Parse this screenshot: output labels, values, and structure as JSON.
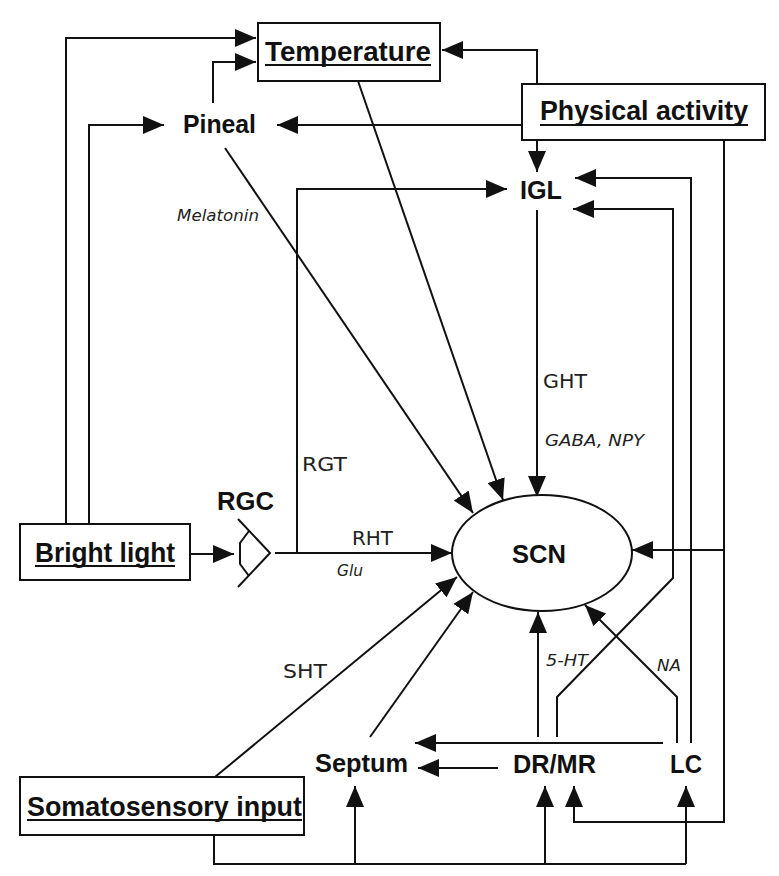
{
  "diagram": {
    "colors": {
      "stroke": "#111111",
      "background": "#ffffff"
    },
    "inputs": {
      "temperature": "Temperature",
      "physical_activity": "Physical activity",
      "bright_light": "Bright light",
      "somatosensory_input": "Somatosensory input"
    },
    "nodes": {
      "pineal": "Pineal",
      "igl": "IGL",
      "rgc": "RGC",
      "scn": "SCN",
      "septum": "Septum",
      "dr_mr": "DR/MR",
      "lc": "LC"
    },
    "pathways": {
      "rgt": "RGT",
      "rht": "RHT",
      "ght": "GHT",
      "sht": "SHT"
    },
    "transmitters": {
      "melatonin": "Melatonin",
      "glu": "Glu",
      "gaba_npy": "GABA, NPY",
      "serotonin": "5-HT",
      "noradrenaline": "NA"
    },
    "edges": [
      {
        "from": "Bright light",
        "to": "Temperature"
      },
      {
        "from": "Bright light",
        "to": "Pineal"
      },
      {
        "from": "Bright light",
        "to": "RGC"
      },
      {
        "from": "Pineal",
        "to": "Temperature"
      },
      {
        "from": "Pineal",
        "to": "SCN",
        "transmitter": "Melatonin"
      },
      {
        "from": "Physical activity",
        "to": "Temperature"
      },
      {
        "from": "Physical activity",
        "to": "Pineal"
      },
      {
        "from": "Physical activity",
        "to": "IGL"
      },
      {
        "from": "Physical activity",
        "to": "SCN"
      },
      {
        "from": "Physical activity",
        "to": "DR/MR"
      },
      {
        "from": "Temperature",
        "to": "SCN"
      },
      {
        "from": "RGC",
        "to": "IGL",
        "pathway": "RGT"
      },
      {
        "from": "RGC",
        "to": "SCN",
        "pathway": "RHT",
        "transmitter": "Glu"
      },
      {
        "from": "IGL",
        "to": "SCN",
        "pathway": "GHT",
        "transmitter": "GABA, NPY"
      },
      {
        "from": "DR/MR",
        "to": "SCN",
        "transmitter": "5-HT"
      },
      {
        "from": "DR/MR",
        "to": "IGL"
      },
      {
        "from": "DR/MR",
        "to": "Septum"
      },
      {
        "from": "LC",
        "to": "SCN",
        "transmitter": "NA"
      },
      {
        "from": "LC",
        "to": "IGL"
      },
      {
        "from": "LC",
        "to": "Septum"
      },
      {
        "from": "Septum",
        "to": "SCN"
      },
      {
        "from": "Somatosensory input",
        "to": "SCN",
        "pathway": "SHT"
      },
      {
        "from": "Somatosensory input",
        "to": "Septum"
      },
      {
        "from": "Somatosensory input",
        "to": "DR/MR"
      },
      {
        "from": "Somatosensory input",
        "to": "LC"
      }
    ]
  }
}
